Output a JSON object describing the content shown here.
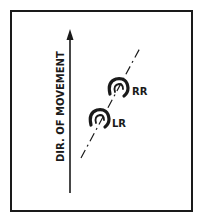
{
  "diagram": {
    "axis_label": "DIR. OF MOVEMENT",
    "tracks": [
      {
        "id": "RR",
        "label": "RR"
      },
      {
        "id": "LR",
        "label": "LR"
      }
    ],
    "colors": {
      "ink": "#1a1a1a",
      "background": "#ffffff"
    }
  }
}
